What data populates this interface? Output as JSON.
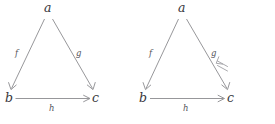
{
  "figure": {
    "background_color": "#ffffff",
    "line_color": "#8b8b8f",
    "label_color": "#37373c",
    "edge_label_color": "#55555b"
  },
  "diagrams": [
    {
      "name": "plain-triangle",
      "vertices": [
        {
          "id": "a",
          "label": "a"
        },
        {
          "id": "b",
          "label": "b"
        },
        {
          "id": "c",
          "label": "c"
        }
      ],
      "edges": [
        {
          "id": "f",
          "label": "f",
          "from": "a",
          "to": "b"
        },
        {
          "id": "g",
          "label": "g",
          "from": "a",
          "to": "c"
        },
        {
          "id": "h",
          "label": "h",
          "from": "b",
          "to": "c"
        }
      ],
      "center_symbol": ""
    },
    {
      "name": "triangle-with-natural-transformation",
      "vertices": [
        {
          "id": "a",
          "label": "a"
        },
        {
          "id": "b",
          "label": "b"
        },
        {
          "id": "c",
          "label": "c"
        }
      ],
      "edges": [
        {
          "id": "f",
          "label": "f",
          "from": "a",
          "to": "b"
        },
        {
          "id": "g",
          "label": "g",
          "from": "a",
          "to": "c"
        },
        {
          "id": "h",
          "label": "h",
          "from": "b",
          "to": "c"
        }
      ],
      "center_symbol": "double-arrow"
    }
  ]
}
